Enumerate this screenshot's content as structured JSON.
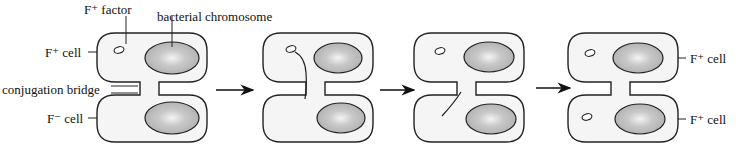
{
  "labels": {
    "f_plus_factor": "F⁺ factor",
    "bacterial_chromosome": "bacterial chromosome",
    "f_plus_cell_left": "F⁺ cell",
    "conjugation_bridge": "conjugation bridge",
    "f_minus_cell_left": "F⁻ cell",
    "f_plus_cell_right_top": "F⁺ cell",
    "f_plus_cell_right_bottom": "F⁺ cell"
  },
  "stages": [
    {
      "index": 1,
      "description": "F+ cell with plasmid joined to F- cell by conjugation bridge"
    },
    {
      "index": 2,
      "description": "Plasmid strand transferring through bridge"
    },
    {
      "index": 3,
      "description": "Strand entering recipient cell"
    },
    {
      "index": 4,
      "description": "Both cells now F+ with plasmid"
    }
  ],
  "arrows": 3,
  "colors": {
    "cell_fill": "#f4f4f4",
    "cell_stroke": "#222222",
    "chromosome_fill": "#b8b8b8",
    "chromosome_highlight": "#f2f2f2"
  }
}
